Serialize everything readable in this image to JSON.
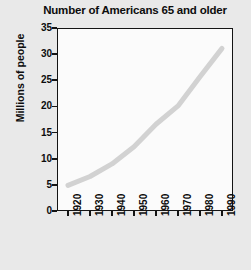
{
  "chart_data": {
    "type": "line",
    "title": "Number of Americans 65 and older",
    "xlabel": "",
    "ylabel": "Millions of people",
    "x": [
      1920,
      1930,
      1940,
      1950,
      1960,
      1970,
      1980,
      1990
    ],
    "values": [
      4.9,
      6.6,
      9.0,
      12.3,
      16.6,
      20.1,
      25.7,
      31.1
    ],
    "series": [
      {
        "name": "Americans 65 and older",
        "values": [
          4.9,
          6.6,
          9.0,
          12.3,
          16.6,
          20.1,
          25.7,
          31.1
        ]
      }
    ],
    "xlim": [
      1915,
      1995
    ],
    "ylim": [
      0,
      35
    ],
    "xticks": [
      1920,
      1930,
      1940,
      1950,
      1960,
      1970,
      1980,
      1990
    ],
    "xtick_labels": [
      "1920",
      "1930",
      "1940",
      "1950",
      "1960",
      "1970",
      "1980",
      "1990"
    ],
    "yticks": [
      0,
      5,
      10,
      15,
      20,
      25,
      30,
      35
    ],
    "ytick_labels": [
      "0",
      "5",
      "10",
      "15",
      "20",
      "25",
      "30",
      "35"
    ],
    "grid": false,
    "legend": false,
    "legend_position": "none",
    "line_color": "#d2d2d2",
    "plot_background": "#fbfbfb",
    "figure_background": "#e9e9e9",
    "axis_color": "#141414",
    "text_color": "#0d0d0d"
  }
}
